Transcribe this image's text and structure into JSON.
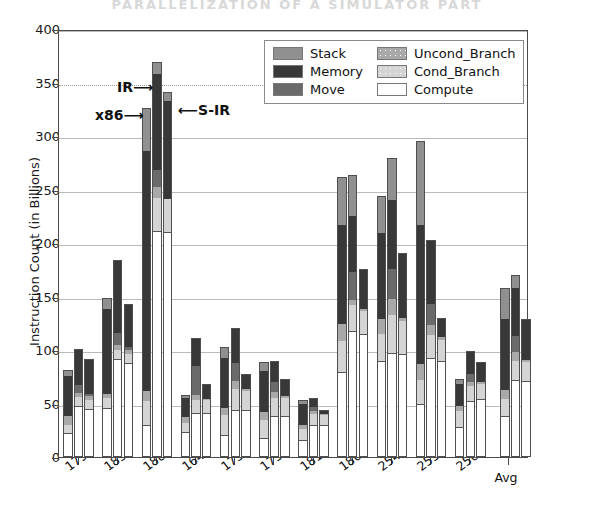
{
  "scan_header_text": "PARALLELIZATION OF A SIMULATOR PART",
  "chart_data": {
    "type": "bar",
    "subtype": "stacked-grouped",
    "title": "",
    "xlabel": "",
    "ylabel": "Instruction Count (in Billions)",
    "ylim": [
      0,
      400
    ],
    "yticks": [
      0,
      50,
      100,
      150,
      200,
      250,
      300,
      350,
      400
    ],
    "ytick_labels": [
      "0",
      "50",
      "100",
      "150",
      "200",
      "250",
      "300",
      "350",
      "400"
    ],
    "grid": "horizontal",
    "legend_position": "upper-center",
    "legend": [
      {
        "label": "Stack",
        "color": "#909090"
      },
      {
        "label": "Memory",
        "color": "#383838"
      },
      {
        "label": "Move",
        "color": "#6a6a6a"
      },
      {
        "label": "Uncond_Branch",
        "color": "#a9a9a9"
      },
      {
        "label": "Cond_Branch",
        "color": "#d4d4d4"
      },
      {
        "label": "Compute",
        "color": "#ffffff"
      }
    ],
    "stack_order": [
      "Compute",
      "Cond_Branch",
      "Uncond_Branch",
      "Move",
      "Memory",
      "Stack"
    ],
    "bar_series": [
      "x86",
      "IR",
      "S-IR"
    ],
    "annotations": [
      {
        "text": "IR⟶",
        "x_px": 117,
        "y_px": 79
      },
      {
        "text": "x86⟶",
        "x_px": 95,
        "y_px": 107
      },
      {
        "text": "⟵S-IR",
        "x_px": 178,
        "y_px": 102
      }
    ],
    "categories": [
      "179.art",
      "183.equake",
      "188.ammp",
      "164.gzip",
      "175.vpr",
      "175.vpr_2",
      "181.mcf",
      "186.crafty",
      "254.gap",
      "255.vortex",
      "256.bzip2",
      "Avg"
    ],
    "groups": [
      {
        "category": "179.art",
        "bars": [
          {
            "name": "x86",
            "total": 81,
            "Compute": 22,
            "Cond_Branch": 8,
            "Uncond_Branch": 8,
            "Move": 0,
            "Memory": 38,
            "Stack": 5
          },
          {
            "name": "IR",
            "total": 101,
            "Compute": 48,
            "Cond_Branch": 8,
            "Uncond_Branch": 4,
            "Move": 7,
            "Memory": 34,
            "Stack": 0
          },
          {
            "name": "S-IR",
            "total": 92,
            "Compute": 45,
            "Cond_Branch": 8,
            "Uncond_Branch": 4,
            "Move": 2,
            "Memory": 33,
            "Stack": 0
          }
        ]
      },
      {
        "category": "183.equake",
        "bars": [
          {
            "name": "x86",
            "total": 149,
            "Compute": 46,
            "Cond_Branch": 9,
            "Uncond_Branch": 4,
            "Move": 0,
            "Memory": 79,
            "Stack": 11
          },
          {
            "name": "IR",
            "total": 184,
            "Compute": 92,
            "Cond_Branch": 8,
            "Uncond_Branch": 5,
            "Move": 11,
            "Memory": 68,
            "Stack": 0
          },
          {
            "name": "S-IR",
            "total": 143,
            "Compute": 88,
            "Cond_Branch": 8,
            "Uncond_Branch": 4,
            "Move": 3,
            "Memory": 40,
            "Stack": 0
          }
        ]
      },
      {
        "category": "188.ammp",
        "bars": [
          {
            "name": "x86",
            "total": 326,
            "Compute": 30,
            "Cond_Branch": 22,
            "Uncond_Branch": 10,
            "Move": 0,
            "Memory": 224,
            "Stack": 40
          },
          {
            "name": "IR",
            "total": 369,
            "Compute": 211,
            "Cond_Branch": 31,
            "Uncond_Branch": 10,
            "Move": 16,
            "Memory": 90,
            "Stack": 11
          },
          {
            "name": "S-IR",
            "total": 341,
            "Compute": 210,
            "Cond_Branch": 31,
            "Uncond_Branch": 0,
            "Move": 0,
            "Memory": 92,
            "Stack": 8
          }
        ]
      },
      {
        "category": "164.gzip",
        "bars": [
          {
            "name": "x86",
            "total": 58,
            "Compute": 23,
            "Cond_Branch": 9,
            "Uncond_Branch": 5,
            "Move": 0,
            "Memory": 18,
            "Stack": 3
          },
          {
            "name": "IR",
            "total": 111,
            "Compute": 41,
            "Cond_Branch": 12,
            "Uncond_Branch": 5,
            "Move": 27,
            "Memory": 26,
            "Stack": 0
          },
          {
            "name": "S-IR",
            "total": 68,
            "Compute": 41,
            "Cond_Branch": 12,
            "Uncond_Branch": 1,
            "Move": 0,
            "Memory": 14,
            "Stack": 0
          }
        ]
      },
      {
        "category": "175.vpr",
        "bars": [
          {
            "name": "x86",
            "total": 103,
            "Compute": 21,
            "Cond_Branch": 18,
            "Uncond_Branch": 7,
            "Move": 0,
            "Memory": 47,
            "Stack": 10
          },
          {
            "name": "IR",
            "total": 121,
            "Compute": 44,
            "Cond_Branch": 20,
            "Uncond_Branch": 7,
            "Move": 17,
            "Memory": 33,
            "Stack": 0
          },
          {
            "name": "S-IR",
            "total": 78,
            "Compute": 44,
            "Cond_Branch": 18,
            "Uncond_Branch": 2,
            "Move": 0,
            "Memory": 14,
            "Stack": 0
          }
        ]
      },
      {
        "category": "175.vpr_2",
        "bars": [
          {
            "name": "x86",
            "total": 89,
            "Compute": 18,
            "Cond_Branch": 17,
            "Uncond_Branch": 7,
            "Move": 0,
            "Memory": 38,
            "Stack": 9
          },
          {
            "name": "IR",
            "total": 90,
            "Compute": 38,
            "Cond_Branch": 17,
            "Uncond_Branch": 6,
            "Move": 9,
            "Memory": 20,
            "Stack": 0
          },
          {
            "name": "S-IR",
            "total": 73,
            "Compute": 38,
            "Cond_Branch": 17,
            "Uncond_Branch": 2,
            "Move": 0,
            "Memory": 16,
            "Stack": 0
          }
        ]
      },
      {
        "category": "181.mcf",
        "bars": [
          {
            "name": "x86",
            "total": 53,
            "Compute": 16,
            "Cond_Branch": 10,
            "Uncond_Branch": 4,
            "Move": 0,
            "Memory": 20,
            "Stack": 3
          },
          {
            "name": "IR",
            "total": 55,
            "Compute": 30,
            "Cond_Branch": 10,
            "Uncond_Branch": 3,
            "Move": 4,
            "Memory": 8,
            "Stack": 0
          },
          {
            "name": "S-IR",
            "total": 44,
            "Compute": 30,
            "Cond_Branch": 9,
            "Uncond_Branch": 1,
            "Move": 0,
            "Memory": 4,
            "Stack": 0
          }
        ]
      },
      {
        "category": "186.crafty",
        "bars": [
          {
            "name": "x86",
            "total": 262,
            "Compute": 79,
            "Cond_Branch": 29,
            "Uncond_Branch": 16,
            "Move": 0,
            "Memory": 93,
            "Stack": 45
          },
          {
            "name": "IR",
            "total": 264,
            "Compute": 118,
            "Cond_Branch": 24,
            "Uncond_Branch": 5,
            "Move": 26,
            "Memory": 52,
            "Stack": 39
          },
          {
            "name": "S-IR",
            "total": 176,
            "Compute": 115,
            "Cond_Branch": 21,
            "Uncond_Branch": 2,
            "Move": 0,
            "Memory": 38,
            "Stack": 0
          }
        ]
      },
      {
        "category": "254.gap",
        "bars": [
          {
            "name": "x86",
            "total": 244,
            "Compute": 90,
            "Cond_Branch": 25,
            "Uncond_Branch": 14,
            "Move": 0,
            "Memory": 80,
            "Stack": 35
          },
          {
            "name": "IR",
            "total": 279,
            "Compute": 97,
            "Cond_Branch": 36,
            "Uncond_Branch": 15,
            "Move": 28,
            "Memory": 64,
            "Stack": 39
          },
          {
            "name": "S-IR",
            "total": 191,
            "Compute": 96,
            "Cond_Branch": 31,
            "Uncond_Branch": 3,
            "Move": 0,
            "Memory": 61,
            "Stack": 0
          }
        ]
      },
      {
        "category": "255.vortex",
        "bars": [
          {
            "name": "x86",
            "total": 295,
            "Compute": 50,
            "Cond_Branch": 22,
            "Uncond_Branch": 15,
            "Move": 0,
            "Memory": 130,
            "Stack": 78
          },
          {
            "name": "IR",
            "total": 203,
            "Compute": 93,
            "Cond_Branch": 21,
            "Uncond_Branch": 9,
            "Move": 20,
            "Memory": 60,
            "Stack": 0
          },
          {
            "name": "S-IR",
            "total": 130,
            "Compute": 90,
            "Cond_Branch": 19,
            "Uncond_Branch": 3,
            "Move": 0,
            "Memory": 18,
            "Stack": 0
          }
        ]
      },
      {
        "category": "256.bzip2",
        "bars": [
          {
            "name": "x86",
            "total": 73,
            "Compute": 28,
            "Cond_Branch": 15,
            "Uncond_Branch": 5,
            "Move": 0,
            "Memory": 20,
            "Stack": 5
          },
          {
            "name": "IR",
            "total": 99,
            "Compute": 52,
            "Cond_Branch": 14,
            "Uncond_Branch": 4,
            "Move": 8,
            "Memory": 21,
            "Stack": 0
          },
          {
            "name": "S-IR",
            "total": 89,
            "Compute": 54,
            "Cond_Branch": 14,
            "Uncond_Branch": 2,
            "Move": 0,
            "Memory": 19,
            "Stack": 0
          }
        ]
      },
      {
        "category": "Avg",
        "bars": [
          {
            "name": "x86",
            "total": 158,
            "Compute": 38,
            "Cond_Branch": 16,
            "Uncond_Branch": 9,
            "Move": 0,
            "Memory": 66,
            "Stack": 29
          },
          {
            "name": "IR",
            "total": 170,
            "Compute": 72,
            "Cond_Branch": 18,
            "Uncond_Branch": 8,
            "Move": 15,
            "Memory": 45,
            "Stack": 12
          },
          {
            "name": "S-IR",
            "total": 129,
            "Compute": 71,
            "Cond_Branch": 18,
            "Uncond_Branch": 2,
            "Move": 0,
            "Memory": 38,
            "Stack": 0
          }
        ]
      }
    ]
  }
}
